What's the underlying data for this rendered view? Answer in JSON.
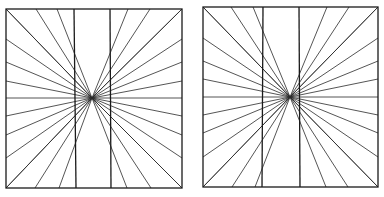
{
  "figure": {
    "title": "",
    "stroke_color": "#1a1a1a",
    "background": "#ffffff"
  },
  "panels": [
    {
      "id": "left",
      "box": {
        "x1": 6,
        "y1": 9,
        "x2": 182,
        "y2": 188
      },
      "center": {
        "x": 92,
        "y": 98
      },
      "verticals": [
        {
          "x_top": 74,
          "x_bottom": 76
        },
        {
          "x_top": 110,
          "x_bottom": 111
        }
      ],
      "ray_targets": {
        "top": [
          6,
          36,
          57,
          128,
          150,
          182
        ],
        "bottom": [
          6,
          35,
          59,
          127,
          151,
          182
        ],
        "left": [
          9,
          39,
          62,
          81,
          98,
          116,
          135,
          158,
          188
        ],
        "right": [
          9,
          39,
          62,
          81,
          98,
          116,
          135,
          158,
          188
        ]
      }
    },
    {
      "id": "right",
      "box": {
        "x1": 203,
        "y1": 7,
        "x2": 378,
        "y2": 187
      },
      "center": {
        "x": 290,
        "y": 97
      },
      "verticals": [
        {
          "x_top": 263,
          "x_bottom": 262
        },
        {
          "x_top": 299,
          "x_bottom": 300
        }
      ],
      "ray_targets": {
        "top": [
          203,
          231,
          253,
          327,
          349,
          378
        ],
        "bottom": [
          203,
          232,
          255,
          326,
          348,
          378
        ],
        "left": [
          7,
          38,
          61,
          79,
          97,
          115,
          133,
          157,
          187
        ],
        "right": [
          7,
          38,
          61,
          79,
          97,
          115,
          133,
          157,
          187
        ]
      }
    }
  ]
}
